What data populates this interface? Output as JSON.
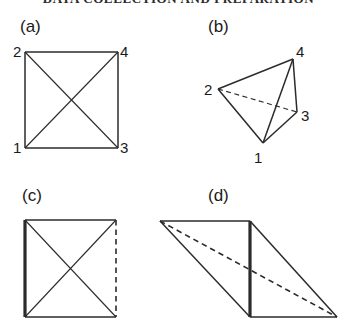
{
  "page": {
    "running_head": "DATA COLLECTION AND PREPARATION",
    "width": 357,
    "height": 330,
    "background": "#ffffff",
    "ink_color": "#2b2b2b"
  },
  "panels": [
    {
      "id": "a",
      "label": "(a)",
      "label_pos": {
        "x": 20,
        "y": 18
      },
      "caption": "square with both diagonals, vertices numbered",
      "vertex_labels": [
        {
          "text": "2",
          "x": 13,
          "y": 44
        },
        {
          "text": "4",
          "x": 120,
          "y": 44
        },
        {
          "text": "1",
          "x": 13,
          "y": 140
        },
        {
          "text": "3",
          "x": 120,
          "y": 140
        }
      ],
      "vertices": {
        "v1": {
          "x": 25,
          "y": 148
        },
        "v2": {
          "x": 25,
          "y": 52
        },
        "v3": {
          "x": 118,
          "y": 148
        },
        "v4": {
          "x": 118,
          "y": 52
        }
      },
      "edges": [
        {
          "from": "v2",
          "to": "v4",
          "style": "solid",
          "weight": "normal"
        },
        {
          "from": "v4",
          "to": "v3",
          "style": "solid",
          "weight": "normal"
        },
        {
          "from": "v3",
          "to": "v1",
          "style": "solid",
          "weight": "normal"
        },
        {
          "from": "v1",
          "to": "v2",
          "style": "solid",
          "weight": "normal"
        },
        {
          "from": "v2",
          "to": "v3",
          "style": "solid",
          "weight": "thin"
        },
        {
          "from": "v1",
          "to": "v4",
          "style": "solid",
          "weight": "thin"
        }
      ]
    },
    {
      "id": "b",
      "label": "(b)",
      "label_pos": {
        "x": 208,
        "y": 18
      },
      "caption": "tetrahedron, hidden edge 2-3 dashed",
      "vertex_labels": [
        {
          "text": "2",
          "x": 204,
          "y": 82
        },
        {
          "text": "4",
          "x": 296,
          "y": 44
        },
        {
          "text": "3",
          "x": 301,
          "y": 108
        },
        {
          "text": "1",
          "x": 254,
          "y": 150
        }
      ],
      "vertices": {
        "v1": {
          "x": 263,
          "y": 143
        },
        "v2": {
          "x": 218,
          "y": 89
        },
        "v3": {
          "x": 297,
          "y": 112
        },
        "v4": {
          "x": 293,
          "y": 59
        }
      },
      "edges": [
        {
          "from": "v2",
          "to": "v4",
          "style": "solid",
          "weight": "normal"
        },
        {
          "from": "v4",
          "to": "v3",
          "style": "solid",
          "weight": "normal"
        },
        {
          "from": "v4",
          "to": "v1",
          "style": "solid",
          "weight": "normal"
        },
        {
          "from": "v2",
          "to": "v1",
          "style": "solid",
          "weight": "normal"
        },
        {
          "from": "v1",
          "to": "v3",
          "style": "solid",
          "weight": "normal"
        },
        {
          "from": "v2",
          "to": "v3",
          "style": "dashed",
          "weight": "thin"
        }
      ]
    },
    {
      "id": "c",
      "label": "(c)",
      "label_pos": {
        "x": 22,
        "y": 187
      },
      "caption": "square with both diagonals, left edge bold, right edge dashed",
      "vertex_labels": [],
      "vertices": {
        "v1": {
          "x": 25,
          "y": 317
        },
        "v2": {
          "x": 25,
          "y": 220
        },
        "v3": {
          "x": 116,
          "y": 317
        },
        "v4": {
          "x": 116,
          "y": 220
        }
      },
      "edges": [
        {
          "from": "v2",
          "to": "v4",
          "style": "solid",
          "weight": "normal"
        },
        {
          "from": "v3",
          "to": "v1",
          "style": "solid",
          "weight": "normal"
        },
        {
          "from": "v1",
          "to": "v2",
          "style": "solid",
          "weight": "thick"
        },
        {
          "from": "v4",
          "to": "v3",
          "style": "dashed",
          "weight": "normal"
        },
        {
          "from": "v2",
          "to": "v3",
          "style": "solid",
          "weight": "thin"
        },
        {
          "from": "v1",
          "to": "v4",
          "style": "solid",
          "weight": "thin"
        }
      ]
    },
    {
      "id": "d",
      "label": "(d)",
      "label_pos": {
        "x": 208,
        "y": 187
      },
      "caption": "sheared parallelogram, bold middle edge, dashed diagonal",
      "vertex_labels": [],
      "vertices": {
        "v1": {
          "x": 250,
          "y": 317
        },
        "v2": {
          "x": 160,
          "y": 221
        },
        "v3": {
          "x": 337,
          "y": 317
        },
        "v4": {
          "x": 250,
          "y": 221
        }
      },
      "edges": [
        {
          "from": "v2",
          "to": "v4",
          "style": "solid",
          "weight": "normal"
        },
        {
          "from": "v4",
          "to": "v3",
          "style": "solid",
          "weight": "normal"
        },
        {
          "from": "v1",
          "to": "v3",
          "style": "solid",
          "weight": "normal"
        },
        {
          "from": "v2",
          "to": "v1",
          "style": "solid",
          "weight": "normal"
        },
        {
          "from": "v1",
          "to": "v4",
          "style": "solid",
          "weight": "thick"
        },
        {
          "from": "v2",
          "to": "v3",
          "style": "dashed",
          "weight": "normal"
        }
      ]
    }
  ]
}
